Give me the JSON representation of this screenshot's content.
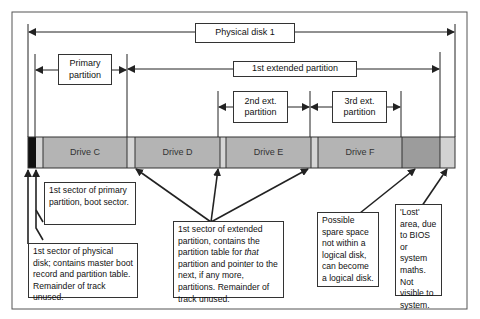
{
  "diagram": {
    "title": "Physical disk 1",
    "spans": {
      "physical_disk": "Physical disk 1",
      "primary_partition": "Primary partition",
      "extended_partition": "1st extended partition",
      "second_ext": "2nd ext. partition",
      "third_ext": "3rd ext. partition"
    },
    "drives": [
      {
        "label": "Drive C"
      },
      {
        "label": "Drive D"
      },
      {
        "label": "Drive E"
      },
      {
        "label": "Drive F"
      }
    ],
    "notes": {
      "primary_boot": "1st sector of primary partition, boot sector.",
      "mbr": "1st sector of physical disk; contains master boot record and partition table. Remainder of track unused.",
      "extended_pre": "1st sector of extended partition, contains the partition table for ",
      "extended_em": "that",
      "extended_post": " partition and pointer to the next, if any more, partitions. Remainder of track unused.",
      "spare": "Possible spare space not within a logical disk, can become a logical disk.",
      "lost": "'Lost' area, due to BIOS or system maths. Not visible to system."
    },
    "colors": {
      "drive": "#b4b4b4",
      "gap": "#d6d6d6",
      "mbr": "#111111",
      "spare": "#9c9c9c",
      "lost": "#d2d2d2",
      "line": "#222222"
    }
  }
}
